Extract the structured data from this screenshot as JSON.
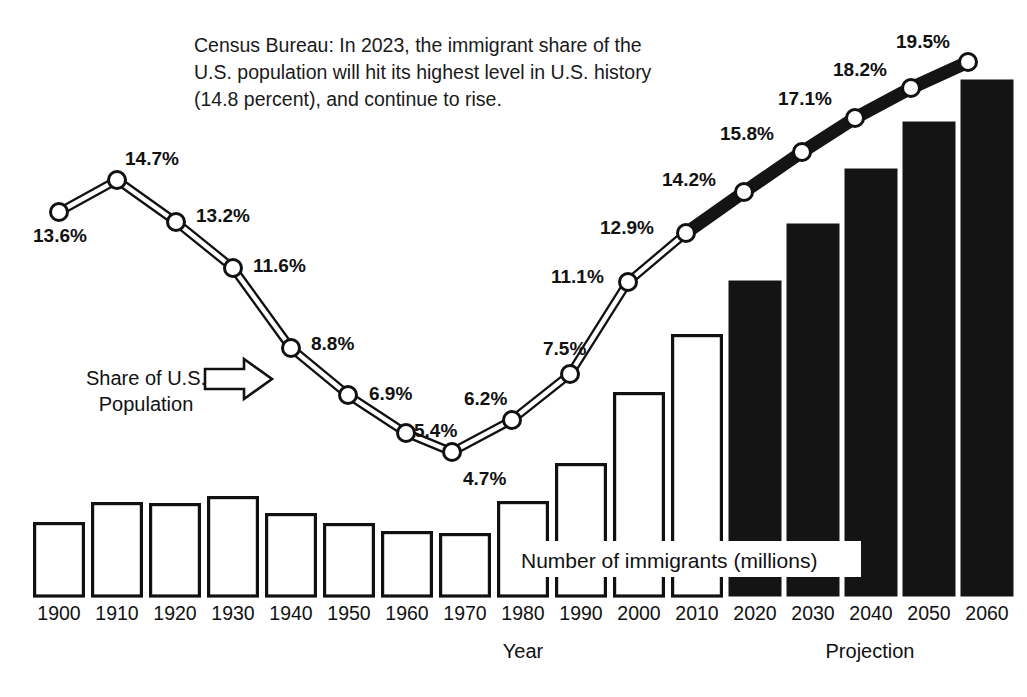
{
  "annotation": {
    "line1": "Census Bureau: In 2023, the immigrant share of the",
    "line2": "U.S. population will hit its highest level in U.S. history",
    "line3": "(14.8 percent), and continue to rise."
  },
  "captions": {
    "share_line1": "Share of U.S.",
    "share_line2": "Population",
    "bars_caption": "Number of immigrants (millions)",
    "axis_year": "Year",
    "axis_projection": "Projection"
  },
  "colors": {
    "ink": "#111111",
    "paper": "#ffffff",
    "projection_fill": "#141414"
  },
  "chart_data": {
    "type": "bar",
    "title": "",
    "subtitle": "",
    "xlabel": "Year",
    "ylabel": "",
    "grid": false,
    "legend": false,
    "categories": [
      "1900",
      "1910",
      "1920",
      "1930",
      "1940",
      "1950",
      "1960",
      "1970",
      "1980",
      "1990",
      "2000",
      "2010",
      "2020",
      "2030",
      "2040",
      "2050",
      "2060"
    ],
    "series": [
      {
        "name": "Number of immigrants (millions)",
        "type": "bar",
        "values": [
          10.3,
          13.5,
          13.9,
          14.2,
          11.6,
          10.3,
          9.7,
          9.6,
          14.1,
          19.8,
          31.1,
          40.0,
          47.0,
          54.0,
          60.5,
          65.5,
          69.5
        ],
        "projection_from": "2020",
        "style": {
          "historical": "hollow",
          "projection": "solid"
        }
      },
      {
        "name": "Share of U.S. Population",
        "type": "line",
        "unit": "percent",
        "values": [
          13.6,
          14.7,
          13.2,
          11.6,
          8.8,
          6.9,
          5.4,
          4.7,
          6.2,
          7.5,
          11.1,
          12.9,
          14.2,
          15.8,
          17.1,
          18.2,
          19.5
        ],
        "labels": [
          "13.6%",
          "14.7%",
          "13.2%",
          "11.6%",
          "8.8%",
          "6.9%",
          "5.4%",
          "4.7%",
          "6.2%",
          "7.5%",
          "11.1%",
          "12.9%",
          "14.2%",
          "15.8%",
          "17.1%",
          "18.2%",
          "19.5%"
        ],
        "projection_from": "2010",
        "style": {
          "historical": "outlined",
          "projection": "solid-thick"
        }
      }
    ],
    "annotations": [
      "Census Bureau: In 2023, the immigrant share of the U.S. population will hit its highest level in U.S. history (14.8 percent), and continue to rise."
    ]
  },
  "geometry": {
    "line_points": [
      {
        "year": "1900",
        "x": 59,
        "y": 212,
        "label": "13.6%",
        "lx": 33,
        "ly": 242
      },
      {
        "year": "1910",
        "x": 117,
        "y": 180,
        "label": "14.7%",
        "lx": 125,
        "ly": 165
      },
      {
        "year": "1920",
        "x": 176,
        "y": 222,
        "label": "13.2%",
        "lx": 196,
        "ly": 222
      },
      {
        "year": "1930",
        "x": 233,
        "y": 268,
        "label": "11.6%",
        "lx": 253,
        "ly": 272
      },
      {
        "year": "1940",
        "x": 291,
        "y": 348,
        "label": "8.8%",
        "lx": 311,
        "ly": 350
      },
      {
        "year": "1950",
        "x": 348,
        "y": 395,
        "label": "6.9%",
        "lx": 369,
        "ly": 400
      },
      {
        "year": "1960",
        "x": 406,
        "y": 433,
        "label": "5.4%",
        "lx": 414,
        "ly": 437
      },
      {
        "year": "1970",
        "x": 452,
        "y": 452,
        "label": "4.7%",
        "lx": 463,
        "ly": 485
      },
      {
        "year": "1980",
        "x": 512,
        "y": 420,
        "label": "6.2%",
        "lx": 464,
        "ly": 405
      },
      {
        "year": "1990",
        "x": 570,
        "y": 374,
        "label": "7.5%",
        "lx": 543,
        "ly": 355
      },
      {
        "year": "2000",
        "x": 628,
        "y": 282,
        "label": "11.1%",
        "lx": 551,
        "ly": 283
      },
      {
        "year": "2010",
        "x": 686,
        "y": 233,
        "label": "12.9%",
        "lx": 600,
        "ly": 234
      },
      {
        "year": "2020",
        "x": 744,
        "y": 192,
        "label": "14.2%",
        "lx": 662,
        "ly": 186
      },
      {
        "year": "2030",
        "x": 802,
        "y": 152,
        "label": "15.8%",
        "lx": 720,
        "ly": 140
      },
      {
        "year": "2040",
        "x": 855,
        "y": 118,
        "label": "17.1%",
        "lx": 778,
        "ly": 105
      },
      {
        "year": "2050",
        "x": 911,
        "y": 88,
        "label": "18.2%",
        "lx": 833,
        "ly": 76
      },
      {
        "year": "2060",
        "x": 968,
        "y": 62,
        "label": "19.5%",
        "lx": 896,
        "ly": 48
      }
    ],
    "bars": [
      {
        "year": "1900",
        "x": 33,
        "w": 52,
        "top": 522,
        "filled": false
      },
      {
        "year": "1910",
        "x": 91,
        "w": 52,
        "top": 502,
        "filled": false
      },
      {
        "year": "1920",
        "x": 149,
        "w": 52,
        "top": 503,
        "filled": false
      },
      {
        "year": "1930",
        "x": 207,
        "w": 52,
        "top": 496,
        "filled": false
      },
      {
        "year": "1940",
        "x": 265,
        "w": 52,
        "top": 513,
        "filled": false
      },
      {
        "year": "1950",
        "x": 323,
        "w": 52,
        "top": 523,
        "filled": false
      },
      {
        "year": "1960",
        "x": 381,
        "w": 52,
        "top": 531,
        "filled": false
      },
      {
        "year": "1970",
        "x": 439,
        "w": 52,
        "top": 533,
        "filled": false
      },
      {
        "year": "1980",
        "x": 497,
        "w": 52,
        "top": 501,
        "filled": false
      },
      {
        "year": "1990",
        "x": 555,
        "w": 52,
        "top": 463,
        "filled": false
      },
      {
        "year": "2000",
        "x": 613,
        "w": 52,
        "top": 392,
        "filled": false
      },
      {
        "year": "2010",
        "x": 671,
        "w": 52,
        "top": 334,
        "filled": false
      },
      {
        "year": "2020",
        "x": 729,
        "w": 52,
        "top": 281,
        "filled": true
      },
      {
        "year": "2030",
        "x": 787,
        "w": 52,
        "top": 224,
        "filled": true
      },
      {
        "year": "2040",
        "x": 845,
        "w": 52,
        "top": 169,
        "filled": true
      },
      {
        "year": "2050",
        "x": 903,
        "w": 52,
        "top": 122,
        "filled": true
      },
      {
        "year": "2060",
        "x": 961,
        "w": 52,
        "top": 80,
        "filled": true
      }
    ],
    "baseline_y": 596,
    "tick_y": 620
  }
}
